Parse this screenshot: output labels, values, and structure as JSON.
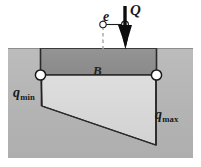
{
  "figure": {
    "labels": {
      "load": "Q",
      "eccentricity": "e",
      "width": "B",
      "pressure_min_base": "q",
      "pressure_min_sub": "min",
      "pressure_max_base": "q",
      "pressure_max_sub": "max"
    },
    "colors": {
      "soil_fill": "#b3b3b3",
      "footing_fill": "#8f8f8f",
      "pressure_fill": "#d9d9d9",
      "outline": "#1f1f1f",
      "arrow": "#0d0d0d",
      "node_fill": "#ffffff",
      "background": "#ffffff",
      "centerline": "#a8a8a8"
    },
    "geometry": {
      "soil_left": 8,
      "soil_right": 193,
      "ground_level_y": 48,
      "soil_bottom": 158,
      "footing_left": 40,
      "footing_right": 157,
      "footing_base_y": 75,
      "pressure_min_depth_y": 106,
      "pressure_max_depth_y": 145,
      "centerline_x": 103,
      "load_line_x": 125,
      "node_radius": 5
    }
  }
}
